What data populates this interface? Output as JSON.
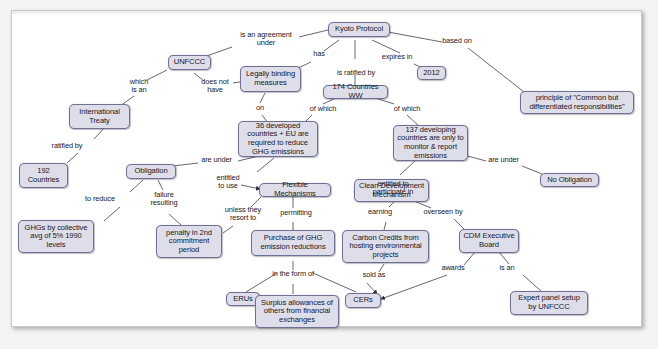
{
  "diagram": {
    "title_node": "Kyoto Protocol",
    "nodes": [
      {
        "id": "kyoto",
        "label": "Kyoto Protocol"
      },
      {
        "id": "unfccc",
        "label": "UNFCCC"
      },
      {
        "id": "legally",
        "label": "Legally binding measures"
      },
      {
        "id": "countries174",
        "label": "174 Countries WW"
      },
      {
        "id": "y2012",
        "label": "2012"
      },
      {
        "id": "principle",
        "label": "principle of \"Common but differentiated responsibilities\""
      },
      {
        "id": "treaty",
        "label": "International Treaty"
      },
      {
        "id": "countries192",
        "label": "192 Countries"
      },
      {
        "id": "dev36",
        "label": "36 developed countries + EU are required to reduce GHG emissions"
      },
      {
        "id": "dev137",
        "label": "137 developing countries are only to monitor & report emissions"
      },
      {
        "id": "obligation",
        "label": "Obligation"
      },
      {
        "id": "noobligation",
        "label": "No Obligation"
      },
      {
        "id": "flexible",
        "label": "Flexible Mechanisms"
      },
      {
        "id": "cdm",
        "label": "Clean Development Mechanism"
      },
      {
        "id": "ghgs",
        "label": "GHGs by collective avg of 5% 1990 levels"
      },
      {
        "id": "penalty",
        "label": "penalty in 2nd commitment period"
      },
      {
        "id": "purchase",
        "label": "Purchase of GHG emission reductions"
      },
      {
        "id": "credits",
        "label": "Carbon Credits from hosting environmental projects"
      },
      {
        "id": "cdmboard",
        "label": "CDM Executive Board"
      },
      {
        "id": "erus",
        "label": "ERUs"
      },
      {
        "id": "surplus",
        "label": "Surplus allowances of others from financial exchanges"
      },
      {
        "id": "cers",
        "label": "CERs"
      },
      {
        "id": "expert",
        "label": "Expert panel setup by UNFCCC"
      }
    ],
    "edge_labels": [
      {
        "id": "e1",
        "text": "is an agreement\nunder"
      },
      {
        "id": "e2",
        "text": "has"
      },
      {
        "id": "e3",
        "text": "is ratified by"
      },
      {
        "id": "e4",
        "text": "expires in"
      },
      {
        "id": "e5",
        "text": "based on"
      },
      {
        "id": "e6",
        "text": "which\nis an"
      },
      {
        "id": "e7",
        "text": "does not\nhave"
      },
      {
        "id": "e8",
        "text": "on"
      },
      {
        "id": "e9",
        "text": "of which"
      },
      {
        "id": "e10",
        "text": "of which"
      },
      {
        "id": "e11",
        "text": "ratified by"
      },
      {
        "id": "e12",
        "text": "are under"
      },
      {
        "id": "e13",
        "text": "are under"
      },
      {
        "id": "e14",
        "text": "entitled\nto use"
      },
      {
        "id": "e15",
        "text": "entitled to\nparticipate in"
      },
      {
        "id": "e16",
        "text": "to reduce"
      },
      {
        "id": "e17",
        "text": "failure\nresulting"
      },
      {
        "id": "e18",
        "text": "unless they\nresort to"
      },
      {
        "id": "e19",
        "text": "permitting"
      },
      {
        "id": "e20",
        "text": "earning"
      },
      {
        "id": "e21",
        "text": "overseen by"
      },
      {
        "id": "e22",
        "text": "in the form of"
      },
      {
        "id": "e23",
        "text": "sold as"
      },
      {
        "id": "e24",
        "text": "awards"
      },
      {
        "id": "e25",
        "text": "is an"
      }
    ],
    "colors": {
      "node_fill": "#dedeeb",
      "node_border": "#6f6f93",
      "edge_stroke": "#3f3f52",
      "page_background": "#ffffff",
      "canvas_background": "#f4f4f4"
    }
  }
}
